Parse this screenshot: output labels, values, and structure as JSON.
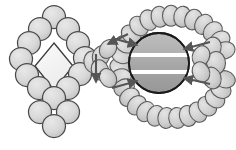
{
  "figure": {
    "title": "Schematic assembly diagram",
    "caption": "Diamond-shaped subunit ring linked through a junction hub to a banded central core encircled by two bead arcs",
    "background_color": "#ffffff",
    "canvas": {
      "width": 236,
      "height": 150
    }
  },
  "palette": {
    "bead_fill": "#d6d6d6",
    "bead_fill_light": "#e2e2e2",
    "bead_stroke": "#4a4a4a",
    "diamond_fill": "#f0f0f0",
    "diamond_stroke": "#3a3a3a",
    "core_fill_top": "#b4b4b4",
    "core_fill_mid": "#a8a8a8",
    "core_fill_bottom": "#9a9a9a",
    "core_stroke": "#1a1a1a",
    "band_color": "#ffffff",
    "arrow_color": "#555555",
    "chain_fill": "#cfcfcf",
    "chain_stroke": "#5a5a5a"
  },
  "left_assembly": {
    "name": "diamond-subunit-ring",
    "subunit_radius": 11.5,
    "subunit_count": 16,
    "subunits": [
      {
        "cx": 54,
        "cy": 17
      },
      {
        "cx": 40,
        "cy": 29
      },
      {
        "cx": 68,
        "cy": 29
      },
      {
        "cx": 29,
        "cy": 43
      },
      {
        "cx": 78,
        "cy": 43
      },
      {
        "cx": 21,
        "cy": 59
      },
      {
        "cx": 85,
        "cy": 58
      },
      {
        "cx": 27,
        "cy": 75
      },
      {
        "cx": 80,
        "cy": 74
      },
      {
        "cx": 39,
        "cy": 88
      },
      {
        "cx": 68,
        "cy": 88
      },
      {
        "cx": 54,
        "cy": 98
      },
      {
        "cx": 40,
        "cy": 112
      },
      {
        "cx": 68,
        "cy": 112
      },
      {
        "cx": 54,
        "cy": 126
      },
      {
        "cx": 54,
        "cy": 126
      }
    ],
    "diamond": {
      "name": "central-diamond-cavity",
      "points": "54,43 73,66 54,90 35,66"
    }
  },
  "junction": {
    "name": "junction-hub",
    "beads": [
      {
        "cx": 93,
        "cy": 62,
        "rx": 9,
        "ry": 11,
        "rot": -12
      },
      {
        "cx": 101,
        "cy": 56,
        "rx": 8.5,
        "ry": 10.5,
        "rot": 20
      },
      {
        "cx": 100,
        "cy": 70,
        "rx": 8.5,
        "ry": 10.5,
        "rot": -20
      },
      {
        "cx": 108,
        "cy": 49,
        "rx": 8,
        "ry": 10,
        "rot": 34
      },
      {
        "cx": 108,
        "cy": 78,
        "rx": 8,
        "ry": 10,
        "rot": -34
      }
    ]
  },
  "right_assembly": {
    "name": "banded-core-complex",
    "core": {
      "name": "central-core-sphere",
      "cx": 159,
      "cy": 63,
      "r": 30,
      "bands": [
        {
          "y": 53,
          "height": 4
        },
        {
          "y": 70,
          "height": 4
        }
      ],
      "band_count": 2
    },
    "top_arc": {
      "name": "upper-bead-chain",
      "path": "M 120 72 C 122 26 150 14 176 16 C 203 18 222 34 226 56",
      "bead_count": 14,
      "bead_rx": 8.5,
      "bead_ry": 10.5
    },
    "bottom_arc": {
      "name": "lower-bead-chain",
      "path": "M 120 72 C 124 104 150 120 176 118 C 203 116 222 98 226 74",
      "bead_count": 14,
      "bead_rx": 8.5,
      "bead_ry": 10.5
    },
    "right_cluster": {
      "name": "right-bead-cluster",
      "beads": [
        {
          "cx": 212,
          "cy": 48,
          "rx": 9,
          "ry": 11,
          "rot": 18
        },
        {
          "cx": 216,
          "cy": 63,
          "rx": 9.5,
          "ry": 11.5,
          "rot": 0
        },
        {
          "cx": 212,
          "cy": 78,
          "rx": 9,
          "ry": 11,
          "rot": -18
        },
        {
          "cx": 201,
          "cy": 56,
          "rx": 8.5,
          "ry": 10.5,
          "rot": 24
        },
        {
          "cx": 201,
          "cy": 72,
          "rx": 8.5,
          "ry": 10.5,
          "rot": -24
        }
      ]
    }
  },
  "arrows": [
    {
      "name": "arrow-top-left-inward",
      "x1": 112,
      "y1": 38,
      "x2": 137,
      "y2": 45,
      "direction": "right-down"
    },
    {
      "name": "arrow-bottom-left-inward",
      "x1": 112,
      "y1": 88,
      "x2": 137,
      "y2": 81,
      "direction": "right-up"
    },
    {
      "name": "arrow-top-right-inward",
      "x1": 210,
      "y1": 42,
      "x2": 184,
      "y2": 49,
      "direction": "left-down"
    },
    {
      "name": "arrow-bottom-right-inward",
      "x1": 210,
      "y1": 84,
      "x2": 184,
      "y2": 78,
      "direction": "left-up"
    },
    {
      "name": "arrow-junction-down",
      "x1": 96,
      "y1": 54,
      "x2": 96,
      "y2": 82,
      "direction": "down"
    },
    {
      "name": "arrow-junction-left",
      "x1": 128,
      "y1": 34,
      "x2": 108,
      "y2": 44,
      "direction": "left-down"
    }
  ],
  "labels": {
    "left_structure": "",
    "right_structure": "",
    "annotation": ""
  }
}
